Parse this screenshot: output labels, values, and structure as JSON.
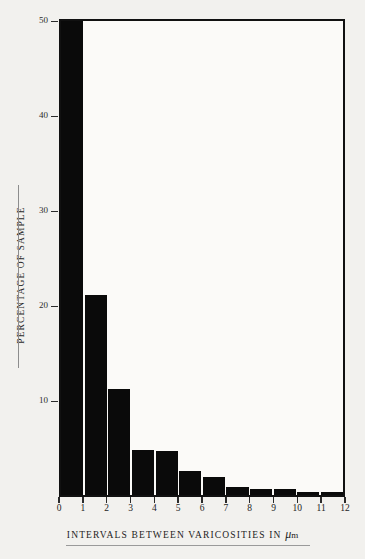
{
  "figure": {
    "background_color": "#f2f1ee",
    "plot_background_color": "#fbfaf8",
    "bar_color": "#0a0a0a",
    "axis_color": "#111111"
  },
  "axes": {
    "y_title": "PERCENTAGE OF SAMPLE",
    "x_caption_text": "INTERVALS BETWEEN VARICOSITIES IN ",
    "x_caption_mu": "μ",
    "x_caption_unit": "m",
    "y_ticks": [
      "50",
      "40",
      "30",
      "20",
      "10"
    ],
    "x_ticks": [
      "0",
      "1",
      "2",
      "3",
      "4",
      "5",
      "6",
      "7",
      "8",
      "9",
      "10",
      "11",
      "12"
    ]
  },
  "chart_data": {
    "type": "bar",
    "title": "",
    "subtitle": "",
    "xlabel": "INTERVALS BETWEEN VARICOSITIES IN μm",
    "ylabel": "PERCENTAGE OF SAMPLE",
    "categories": [
      "0-1",
      "1-2",
      "2-3",
      "3-4",
      "4-5",
      "5-6",
      "6-7",
      "7-8",
      "8-9",
      "9-10",
      "10-11",
      "11-12"
    ],
    "bin_edges": [
      0,
      1,
      2,
      3,
      4,
      5,
      6,
      7,
      8,
      9,
      10,
      11,
      12
    ],
    "values": [
      50.3,
      21.2,
      11.3,
      4.8,
      4.7,
      2.5,
      1.9,
      0.9,
      0.6,
      0.6,
      0.3,
      0.3
    ],
    "xlim": [
      0,
      12
    ],
    "ylim": [
      0,
      50.3
    ],
    "y_tick_values": [
      50,
      40,
      30,
      20,
      10
    ],
    "x_tick_values": [
      0,
      1,
      2,
      3,
      4,
      5,
      6,
      7,
      8,
      9,
      10,
      11,
      12
    ],
    "grid": false,
    "legend": null,
    "legend_position": "none",
    "annotations": []
  }
}
